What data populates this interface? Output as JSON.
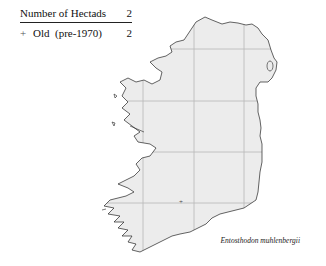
{
  "legend": {
    "header": {
      "label": "Number of Hectads",
      "value": "2"
    },
    "rows": [
      {
        "symbol": "+",
        "label": "Old  (pre-1970)",
        "value": "2"
      }
    ]
  },
  "map": {
    "region": "Ireland",
    "land_color": "#ececec",
    "coast_color": "#222222",
    "grid_color": "#b8b8b8",
    "grid": {
      "vertical_x": [
        143,
        194,
        244
      ],
      "horizontal_y": [
        49,
        101,
        152,
        203
      ]
    },
    "markers": [
      {
        "symbol": "+",
        "x": 181,
        "y": 202,
        "category": "Old (pre-1970)"
      }
    ]
  },
  "species_name": "Entosthodon muhlenbergii"
}
